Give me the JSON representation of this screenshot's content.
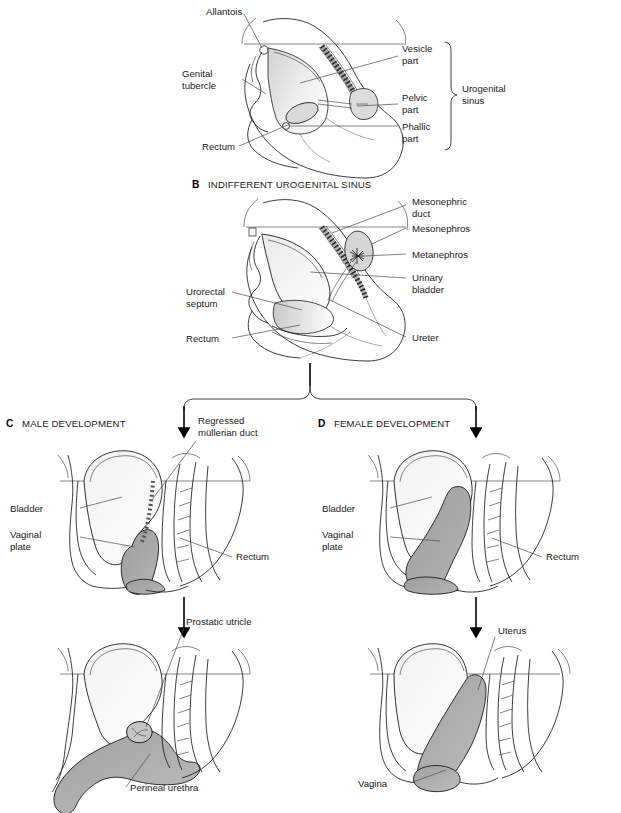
{
  "figure": {
    "type": "anatomical-diagram",
    "background_color": "#ffffff",
    "line_color": "#1a1a1a",
    "shade_dark": "#a8a8a8",
    "shade_light": "#e8e8e8"
  },
  "panel_a": {
    "labels": {
      "allantois": "Allantois",
      "genital_tubercle_l1": "Genital",
      "genital_tubercle_l2": "tubercle",
      "rectum": "Rectum",
      "vesicle_part_l1": "Vesicle",
      "vesicle_part_l2": "part",
      "pelvic_part_l1": "Pelvic",
      "pelvic_part_l2": "part",
      "phallic_part_l1": "Phallic",
      "phallic_part_l2": "part",
      "urogenital_sinus_l1": "Urogenital",
      "urogenital_sinus_l2": "sinus"
    }
  },
  "panel_b": {
    "letter": "B",
    "title": "INDIFFERENT UROGENITAL SINUS",
    "labels": {
      "mesonephric_duct_l1": "Mesonephric",
      "mesonephric_duct_l2": "duct",
      "mesonephros": "Mesonephros",
      "metanephros": "Metanephros",
      "urinary_bladder_l1": "Urinary",
      "urinary_bladder_l2": "bladder",
      "ureter": "Ureter",
      "urorectal_septum_l1": "Urorectal",
      "urorectal_septum_l2": "septum",
      "rectum": "Rectum"
    }
  },
  "panel_c": {
    "letter": "C",
    "title": "MALE DEVELOPMENT",
    "upper": {
      "bladder": "Bladder",
      "vaginal_plate_l1": "Vaginal",
      "vaginal_plate_l2": "plate",
      "regressed_mullerian_duct_l1": "Regressed",
      "regressed_mullerian_duct_l2": "müllerian duct",
      "rectum": "Rectum"
    },
    "lower": {
      "prostatic_utricle": "Prostatic utricle",
      "perineal_urethra": "Perineal urethra"
    }
  },
  "panel_d": {
    "letter": "D",
    "title": "FEMALE DEVELOPMENT",
    "upper": {
      "bladder": "Bladder",
      "vaginal_plate_l1": "Vaginal",
      "vaginal_plate_l2": "plate",
      "rectum": "Rectum"
    },
    "lower": {
      "uterus": "Uterus",
      "vagina": "Vagina"
    }
  }
}
